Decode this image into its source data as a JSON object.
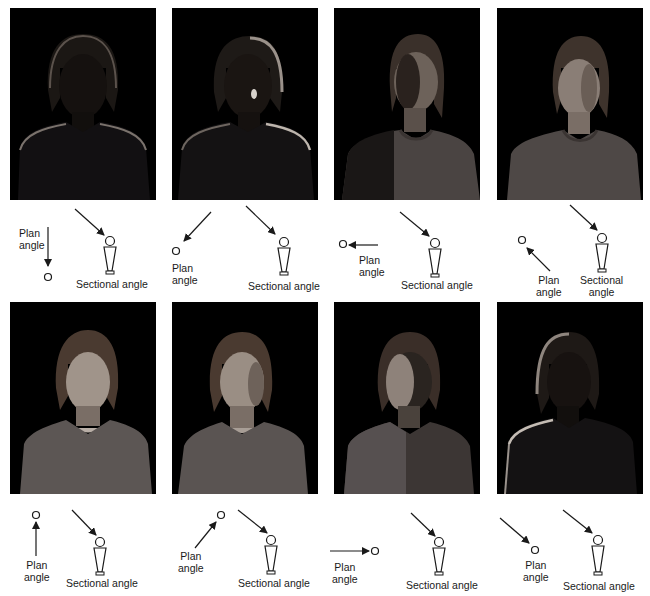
{
  "figure": {
    "panels": [
      {
        "id": 1,
        "photo_alt": "Woman lit from behind, face mostly in shadow, rim light on hair and shoulders",
        "brightness": 0.12,
        "plan": {
          "label_line1": "Plan",
          "label_line2": "angle",
          "direction": "light from directly behind subject (arrow pointing down to subject)"
        },
        "sectional": {
          "label": "Sectional angle",
          "direction": "high, from upper left"
        }
      },
      {
        "id": 2,
        "photo_alt": "Woman lit from behind-right, small highlight on cheek",
        "brightness": 0.18,
        "plan": {
          "label_line1": "Plan",
          "label_line2": "angle",
          "direction": "from upper right (rear 3/4)"
        },
        "sectional": {
          "label": "Sectional angle",
          "direction": "high, from upper left"
        }
      },
      {
        "id": 3,
        "photo_alt": "Woman side-lit from right, half face lit",
        "brightness": 0.38,
        "plan": {
          "label_line1": "Plan",
          "label_line2": "angle",
          "direction": "from right side (90°)"
        },
        "sectional": {
          "label": "Sectional angle",
          "direction": "high, from upper left"
        }
      },
      {
        "id": 4,
        "photo_alt": "Woman lit from front-right 3/4",
        "brightness": 0.5,
        "plan": {
          "label_line1": "Plan",
          "label_line2": "angle",
          "direction": "from lower right (front 3/4)"
        },
        "sectional": {
          "label_line1": "Sectional",
          "label_line2": "angle",
          "direction": "high, from upper left"
        }
      },
      {
        "id": 5,
        "photo_alt": "Woman lit from directly in front, evenly lit face",
        "brightness": 0.55,
        "plan": {
          "label_line1": "Plan",
          "label_line2": "angle",
          "direction": "from directly in front (arrow pointing up to subject)"
        },
        "sectional": {
          "label": "Sectional angle",
          "direction": "high, from upper left"
        }
      },
      {
        "id": 6,
        "photo_alt": "Woman lit from front-left 3/4",
        "brightness": 0.52,
        "plan": {
          "label_line1": "Plan",
          "label_line2": "angle",
          "direction": "from lower left (front 3/4)"
        },
        "sectional": {
          "label": "Sectional angle",
          "direction": "high, from upper left"
        }
      },
      {
        "id": 7,
        "photo_alt": "Woman side-lit from left, half face lit",
        "brightness": 0.4,
        "plan": {
          "label_line1": "Plan",
          "label_line2": "angle",
          "direction": "from left side (90°)"
        },
        "sectional": {
          "label": "Sectional angle",
          "direction": "high, from upper left"
        }
      },
      {
        "id": 8,
        "photo_alt": "Woman lit from behind-left, face in shadow with rim light",
        "brightness": 0.15,
        "plan": {
          "label_line1": "Plan",
          "label_line2": "angle",
          "direction": "from upper left (rear 3/4)"
        },
        "sectional": {
          "label": "Sectional angle",
          "direction": "high, from upper left"
        }
      }
    ]
  },
  "colors": {
    "background": "#ffffff",
    "photo_background": "#000000",
    "line": "#1a1a1a",
    "text": "#1a1a1a"
  }
}
